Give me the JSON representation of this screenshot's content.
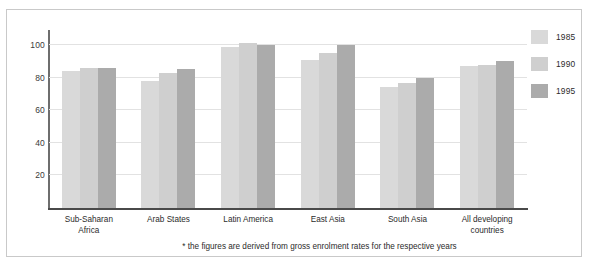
{
  "chart_data": {
    "type": "bar",
    "title": "",
    "subtitle": "",
    "xlabel": "",
    "ylabel": "",
    "ylim": [
      0,
      108
    ],
    "yticks": [
      20,
      40,
      60,
      80,
      100
    ],
    "ytick_labels": [
      "20",
      "40",
      "60",
      "80",
      "100"
    ],
    "grid": true,
    "legend_position": "right",
    "categories": [
      "Sub-Saharan Africa",
      "Arab States",
      "Latin America",
      "East Asia",
      "South Asia",
      "All developing countries"
    ],
    "category_lines": [
      [
        "Sub-Saharan",
        "Africa"
      ],
      [
        "Arab States"
      ],
      [
        "Latin America"
      ],
      [
        "East Asia"
      ],
      [
        "South Asia"
      ],
      [
        "All developing",
        "countries"
      ]
    ],
    "series": [
      {
        "name": "1985",
        "color": "#d9d9d9",
        "values": [
          84,
          78,
          99,
          91,
          74,
          87
        ]
      },
      {
        "name": "1990",
        "color": "#cfcfcf",
        "values": [
          86,
          83,
          101,
          95,
          77,
          88
        ]
      },
      {
        "name": "1995",
        "color": "#ababab",
        "values": [
          86,
          85,
          100,
          100,
          80,
          90
        ]
      }
    ],
    "annotations": [
      "* the figures are derived from gross enrolment rates for the respective years"
    ]
  },
  "legend": {
    "items": [
      {
        "label": "1985",
        "color": "#d9d9d9"
      },
      {
        "label": "1990",
        "color": "#cfcfcf"
      },
      {
        "label": "1995",
        "color": "#ababab"
      }
    ]
  },
  "footnote": {
    "text": "* the figures are derived from gross enrolment rates for the respective years"
  },
  "colors": {
    "frame": "#c9c9c9",
    "gridline": "#e2e2e2",
    "axis": "#4a4a4a",
    "background": "#ffffff",
    "text": "#2b2b2b"
  }
}
